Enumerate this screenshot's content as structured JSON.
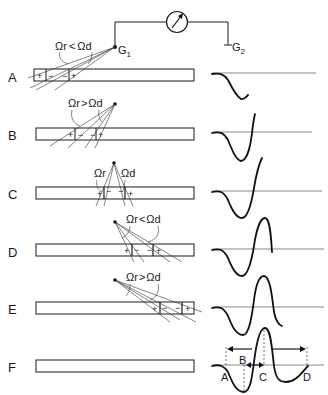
{
  "figure": {
    "meter": {
      "label": "galvanometer",
      "symbol": "↗"
    },
    "electrodes": {
      "g1": "G",
      "g1_sub": "1",
      "g2": "G",
      "g2_sub": "2"
    },
    "rows": [
      {
        "id": "A",
        "label": "A",
        "relation": "Ωr < Ωd",
        "omega_r": "Ωr",
        "op": "<",
        "omega_d": "Ωd",
        "charges": [
          "+",
          "−",
          "−",
          "+"
        ]
      },
      {
        "id": "B",
        "label": "B",
        "relation": "Ωr > Ωd",
        "omega_r": "Ωr",
        "op": ">",
        "omega_d": "Ωd",
        "charges": [
          "+",
          "−",
          "−",
          "+"
        ]
      },
      {
        "id": "C",
        "label": "C",
        "relation": "Ωr  Ωd",
        "omega_r": "Ωr",
        "op": "",
        "omega_d": "Ωd",
        "charges": [
          "+",
          "−",
          "−",
          "+"
        ]
      },
      {
        "id": "D",
        "label": "D",
        "relation": "Ωr < Ωd",
        "omega_r": "Ωr",
        "op": "<",
        "omega_d": "Ωd",
        "charges": [
          "+",
          "−",
          "−",
          "+"
        ]
      },
      {
        "id": "E",
        "label": "E",
        "relation": "Ωr > Ωd",
        "omega_r": "Ωr",
        "op": ">",
        "omega_d": "Ωd",
        "charges": [
          "+",
          "−",
          "−",
          "+"
        ]
      },
      {
        "id": "F",
        "label": "F",
        "relation": "",
        "charges": []
      }
    ],
    "waveform_labels": {
      "a": "A",
      "b": "B",
      "c": "C",
      "d": "D"
    }
  }
}
